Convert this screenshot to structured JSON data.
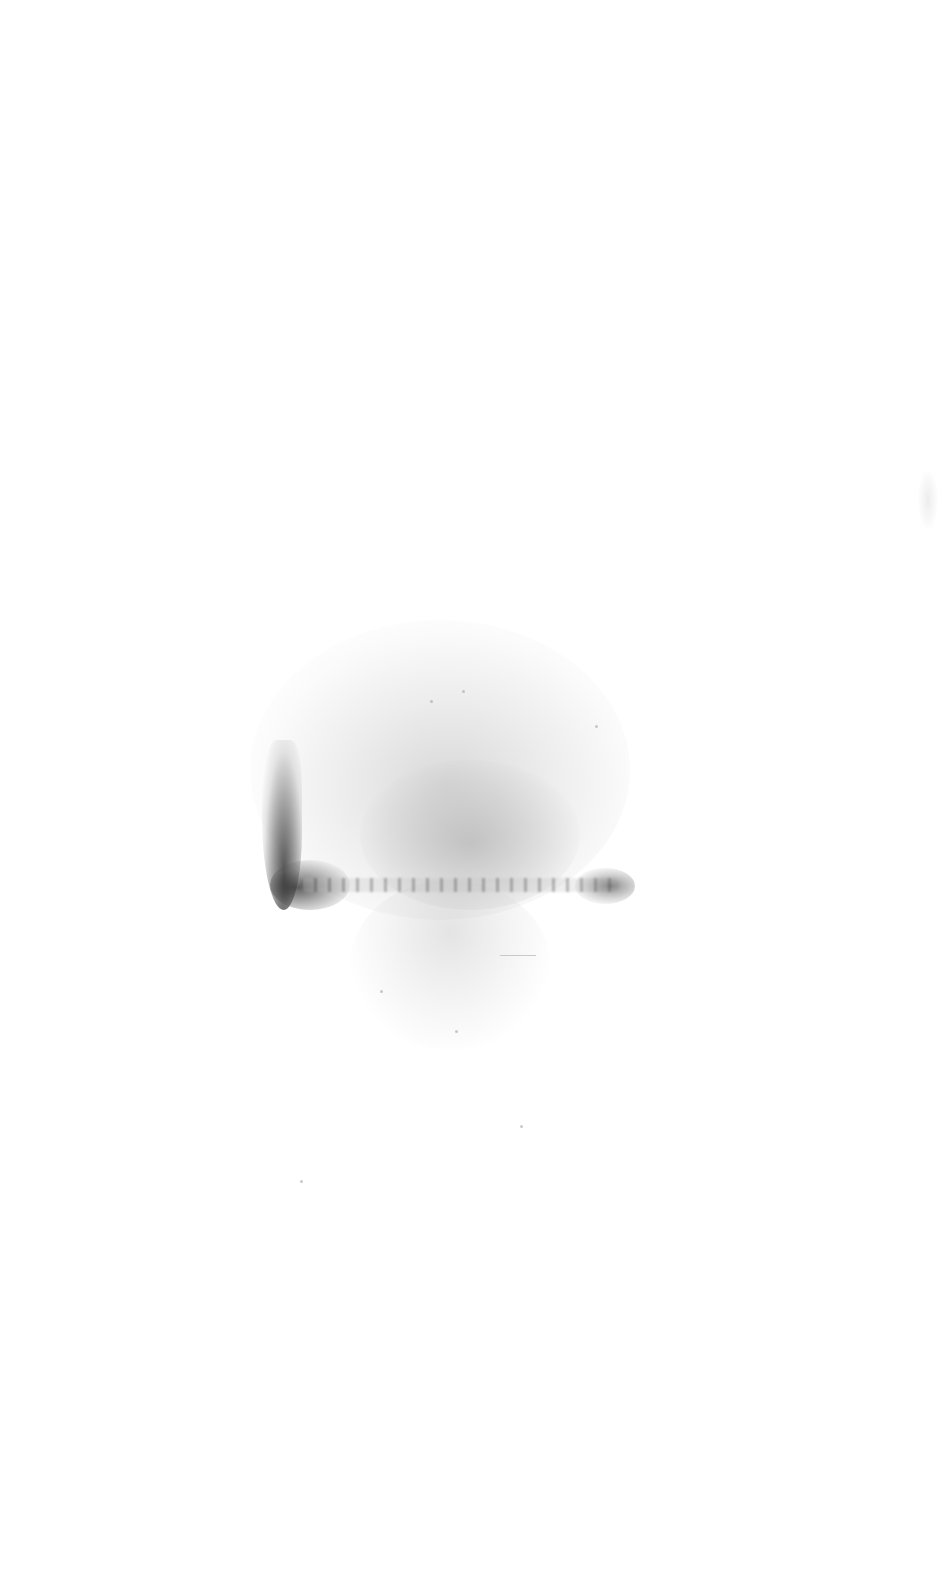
{
  "image": {
    "description": "Blank white page with a grey speckled stain/smudge",
    "background_color": "#ffffff",
    "stain_colors": {
      "light": "#c8c8c8",
      "mid": "#a0a0a0",
      "dark": "#323232"
    }
  }
}
